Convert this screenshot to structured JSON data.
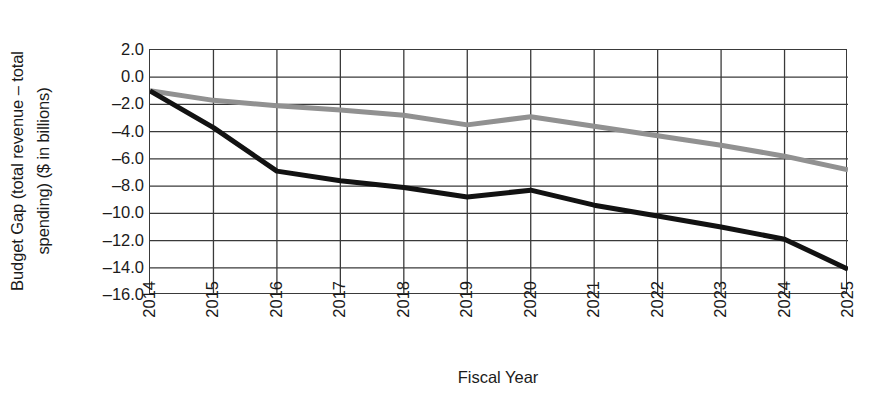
{
  "chart_data": {
    "type": "line",
    "title": "",
    "xlabel": "Fiscal Year",
    "ylabel": "Budget Gap (total revenue – total spending) ($ in billions)",
    "ylabel_line1": "Budget Gap (total revenue – total",
    "ylabel_line2": "spending) ($ in billions)",
    "categories": [
      "2014",
      "2015",
      "2016",
      "2017",
      "2018",
      "2019",
      "2020",
      "2021",
      "2022",
      "2023",
      "2024",
      "2025"
    ],
    "x": [
      2014,
      2015,
      2016,
      2017,
      2018,
      2019,
      2020,
      2021,
      2022,
      2023,
      2024,
      2025
    ],
    "xlim": [
      2014,
      2025
    ],
    "ylim": [
      -16.0,
      2.0
    ],
    "y_ticks": [
      2.0,
      0.0,
      -2.0,
      -4.0,
      -6.0,
      -8.0,
      -10.0,
      -12.0,
      -14.0,
      -16.0
    ],
    "y_tick_labels": [
      "2.0",
      "0.0",
      "–2.0",
      "–4.0",
      "–6.0",
      "–8.0",
      "–10.0",
      "–12.0",
      "–14.0",
      "–16.0"
    ],
    "grid": true,
    "grid_x": true,
    "grid_y": true,
    "legend": "none",
    "series": [
      {
        "name": "gray-series",
        "color": "#919191",
        "line_width": 5,
        "values": [
          -1.0,
          -1.7,
          -2.1,
          -2.4,
          -2.8,
          -3.5,
          -2.9,
          -3.6,
          -4.3,
          -5.0,
          -5.8,
          -6.8
        ]
      },
      {
        "name": "black-series",
        "color": "#121212",
        "line_width": 5,
        "values": [
          -1.0,
          -3.7,
          -6.9,
          -7.6,
          -8.1,
          -8.8,
          -8.3,
          -9.4,
          -10.2,
          -11.0,
          -11.9,
          -14.1
        ]
      }
    ]
  },
  "axes": {
    "x_title": "Fiscal Year"
  }
}
